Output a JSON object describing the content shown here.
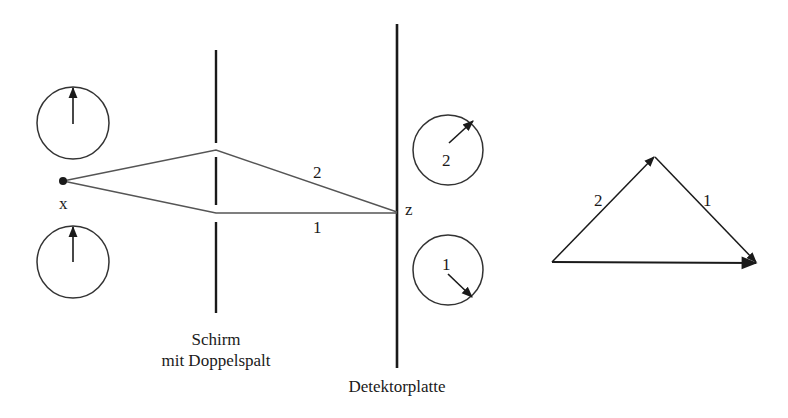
{
  "diagram": {
    "type": "double-slit path-amplitude diagram",
    "colors": {
      "line": "#1a1a1a",
      "ray": "#555555",
      "background": "#ffffff"
    },
    "source": {
      "label": "x"
    },
    "target_point": {
      "label": "z"
    },
    "screen": {
      "label_line1": "Schirm",
      "label_line2": "mit Doppelspalt"
    },
    "detector": {
      "label": "Detektorplatte"
    },
    "paths": [
      {
        "id": "path-1",
        "label": "1"
      },
      {
        "id": "path-2",
        "label": "2"
      }
    ],
    "source_clocks": [
      {
        "id": "clock-top",
        "hand_direction": "up"
      },
      {
        "id": "clock-bottom",
        "hand_direction": "up"
      }
    ],
    "detector_clocks": [
      {
        "id": "clock-path-2",
        "label": "2",
        "hand_direction": "up-right"
      },
      {
        "id": "clock-path-1",
        "label": "1",
        "hand_direction": "down-right"
      }
    ],
    "vector_sum": {
      "arrows": [
        {
          "label": "2",
          "direction": "up-right"
        },
        {
          "label": "1",
          "direction": "down-right"
        },
        {
          "label": "",
          "direction": "resultant, right"
        }
      ]
    }
  }
}
